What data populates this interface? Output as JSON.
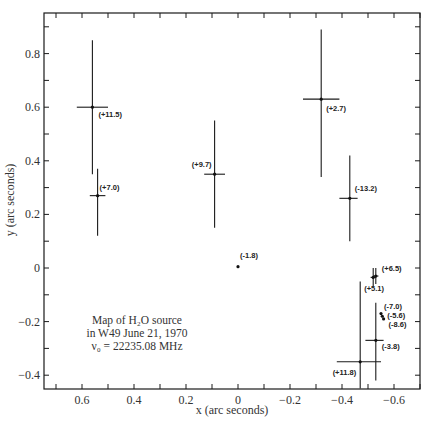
{
  "chart_data": {
    "type": "scatter",
    "annotation": [
      "Map of H₂O source",
      "in W49 June 21, 1970",
      "ν₀ = 22235.08 MHz"
    ],
    "xlabel": "x  (arc seconds)",
    "ylabel": "y (arc seconds)",
    "xlim": [
      0.7,
      -0.7
    ],
    "ylim": [
      -0.45,
      0.95
    ],
    "x_ticks": [
      0.6,
      0.4,
      0.2,
      0,
      -0.2,
      -0.4,
      -0.6
    ],
    "x_tick_labels": [
      "0.6",
      "0.4",
      "0.2",
      "0",
      "−0.2",
      "−0.4",
      "−0.6"
    ],
    "y_ticks": [
      0.8,
      0.6,
      0.4,
      0.2,
      0,
      -0.2,
      -0.4
    ],
    "y_tick_labels": [
      "0.8",
      "0.6",
      "0.4",
      "0.2",
      "0",
      "−0.2",
      "−0.4"
    ],
    "grid": false,
    "points": [
      {
        "label": "(+11.5)",
        "x": 0.56,
        "y": 0.6,
        "x_err": [
          0.62,
          0.5
        ],
        "y_err": [
          0.35,
          0.85
        ]
      },
      {
        "label": "(+7.0)",
        "x": 0.54,
        "y": 0.27,
        "x_err": [
          0.57,
          0.51
        ],
        "y_err": [
          0.12,
          0.37
        ]
      },
      {
        "label": "(+9.7)",
        "x": 0.09,
        "y": 0.35,
        "x_err": [
          0.13,
          0.05
        ],
        "y_err": [
          0.15,
          0.55
        ]
      },
      {
        "label": "(+2.7)",
        "x": -0.32,
        "y": 0.63,
        "x_err": [
          -0.25,
          -0.39
        ],
        "y_err": [
          0.34,
          0.89
        ]
      },
      {
        "label": "(-13.2)",
        "x": -0.43,
        "y": 0.26,
        "x_err": [
          -0.39,
          -0.46
        ],
        "y_err": [
          0.1,
          0.42
        ]
      },
      {
        "label": "(-1.8)",
        "x": 0.0,
        "y": 0.005
      },
      {
        "label": "(+6.5)",
        "x": -0.53,
        "y": -0.03,
        "x_err": [
          -0.52,
          -0.54
        ],
        "y_err": [
          -0.06,
          0.0
        ]
      },
      {
        "label": "(+5.1)",
        "x": -0.52,
        "y": -0.035,
        "x_err": [
          -0.51,
          -0.53
        ],
        "y_err": [
          -0.07,
          0.0
        ]
      },
      {
        "label": "(-7.0)",
        "x": -0.55,
        "y": -0.17
      },
      {
        "label": "(-5.6)",
        "x": -0.555,
        "y": -0.18
      },
      {
        "label": "(-8.6)",
        "x": -0.56,
        "y": -0.19
      },
      {
        "label": "(-3.8)",
        "x": -0.53,
        "y": -0.27,
        "x_err": [
          -0.49,
          -0.56
        ],
        "y_err": [
          -0.42,
          -0.13
        ]
      },
      {
        "label": "(+11.8)",
        "x": -0.47,
        "y": -0.35,
        "x_err": [
          -0.38,
          -0.55
        ],
        "y_err": [
          -0.45,
          -0.05
        ]
      }
    ]
  },
  "colors": {
    "ink": "#1a1a1a",
    "background": "#ffffff"
  }
}
